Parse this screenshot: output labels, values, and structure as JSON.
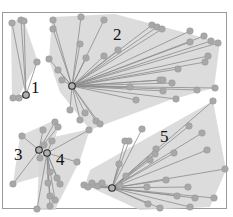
{
  "diagram": {
    "type": "cluster-star-diagram",
    "colors": {
      "hull": "#d6d6d6",
      "edge": "#8c8c8c",
      "node": "#a8a8a8",
      "hub_stroke": "#2a2a2a",
      "frame": "#9a9a9a",
      "label": "#111111"
    },
    "clusters": [
      {
        "id": "1",
        "label": "1",
        "label_pos": [
          31,
          93
        ],
        "hub": [
          26,
          95
        ],
        "hull": [
          [
            11,
            22
          ],
          [
            23,
            18
          ],
          [
            38,
            62
          ],
          [
            17,
            99
          ],
          [
            12,
            99
          ]
        ],
        "nodes": [
          [
            12,
            23
          ],
          [
            21,
            20
          ],
          [
            24,
            21
          ],
          [
            37,
            62
          ],
          [
            13,
            98
          ],
          [
            19,
            98
          ]
        ]
      },
      {
        "id": "2",
        "label": "2",
        "label_pos": [
          113,
          40
        ],
        "hub": [
          72,
          86
        ],
        "hull": [
          [
            52,
            17
          ],
          [
            115,
            14
          ],
          [
            220,
            42
          ],
          [
            214,
            88
          ],
          [
            170,
            100
          ],
          [
            90,
            130
          ],
          [
            60,
            92
          ],
          [
            49,
            60
          ]
        ],
        "nodes": [
          [
            53,
            20
          ],
          [
            53,
            29
          ],
          [
            49,
            59
          ],
          [
            58,
            70
          ],
          [
            62,
            80
          ],
          [
            81,
            17
          ],
          [
            104,
            20
          ],
          [
            80,
            44
          ],
          [
            86,
            58
          ],
          [
            104,
            56
          ],
          [
            118,
            50
          ],
          [
            152,
            25
          ],
          [
            157,
            27
          ],
          [
            162,
            29
          ],
          [
            190,
            31
          ],
          [
            190,
            42
          ],
          [
            204,
            36
          ],
          [
            211,
            41
          ],
          [
            218,
            43
          ],
          [
            208,
            56
          ],
          [
            205,
            62
          ],
          [
            178,
            69
          ],
          [
            160,
            80
          ],
          [
            163,
            80
          ],
          [
            172,
            83
          ],
          [
            130,
            87
          ],
          [
            163,
            91
          ],
          [
            197,
            90
          ],
          [
            215,
            88
          ],
          [
            136,
            100
          ],
          [
            176,
            99
          ],
          [
            70,
            110
          ],
          [
            85,
            113
          ],
          [
            96,
            121
          ],
          [
            100,
            124
          ],
          [
            80,
            120
          ]
        ]
      },
      {
        "id": "3",
        "label": "3",
        "label_pos": [
          14,
          160
        ],
        "hub": [
          39,
          150
        ],
        "hull": [
          [
            20,
            136
          ],
          [
            55,
            120
          ],
          [
            58,
            128
          ],
          [
            45,
            175
          ],
          [
            13,
            184
          ]
        ],
        "nodes": [
          [
            22,
            136
          ],
          [
            43,
            130
          ],
          [
            55,
            122
          ],
          [
            58,
            127
          ],
          [
            40,
            158
          ],
          [
            13,
            184
          ],
          [
            44,
            145
          ]
        ]
      },
      {
        "id": "4",
        "label": "4",
        "label_pos": [
          56,
          165
        ],
        "hub": [
          47,
          153
        ],
        "hull": [
          [
            40,
            140
          ],
          [
            90,
            129
          ],
          [
            80,
            160
          ],
          [
            55,
            210
          ],
          [
            37,
            210
          ]
        ],
        "nodes": [
          [
            89,
            130
          ],
          [
            52,
            141
          ],
          [
            77,
            162
          ],
          [
            50,
            172
          ],
          [
            57,
            178
          ],
          [
            60,
            184
          ],
          [
            48,
            183
          ],
          [
            50,
            196
          ],
          [
            50,
            206
          ],
          [
            37,
            209
          ],
          [
            55,
            200
          ]
        ]
      },
      {
        "id": "5",
        "label": "5",
        "label_pos": [
          160,
          142
        ],
        "hub": [
          112,
          188
        ],
        "hull": [
          [
            90,
            170
          ],
          [
            213,
            101
          ],
          [
            226,
            170
          ],
          [
            210,
            207
          ],
          [
            140,
            210
          ],
          [
            85,
            185
          ]
        ],
        "nodes": [
          [
            213,
            101
          ],
          [
            142,
            129
          ],
          [
            189,
            126
          ],
          [
            202,
            133
          ],
          [
            125,
            141
          ],
          [
            129,
            141
          ],
          [
            156,
            149
          ],
          [
            155,
            154
          ],
          [
            174,
            153
          ],
          [
            150,
            160
          ],
          [
            119,
            164
          ],
          [
            207,
            150
          ],
          [
            126,
            176
          ],
          [
            225,
            169
          ],
          [
            92,
            183
          ],
          [
            98,
            186
          ],
          [
            102,
            183
          ],
          [
            120,
            186
          ],
          [
            166,
            180
          ],
          [
            147,
            187
          ],
          [
            188,
            187
          ],
          [
            177,
            196
          ],
          [
            195,
            198
          ],
          [
            214,
            198
          ],
          [
            148,
            204
          ],
          [
            160,
            208
          ],
          [
            190,
            207
          ],
          [
            84,
            185
          ],
          [
            88,
            187
          ]
        ]
      }
    ],
    "frame": {
      "x": 2,
      "y": 12,
      "width": 224,
      "height": 196
    }
  }
}
